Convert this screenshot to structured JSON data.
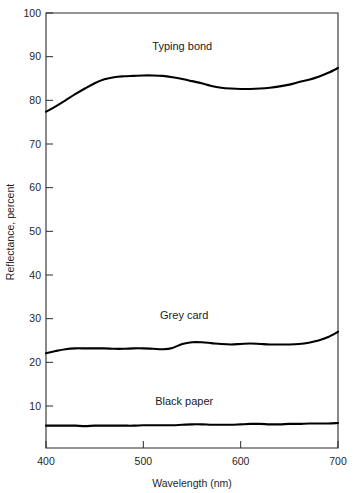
{
  "chart_data": {
    "type": "line",
    "title": "",
    "xlabel": "Wavelength (nm)",
    "ylabel": "Reflectance, percent",
    "xlim": [
      400,
      700
    ],
    "ylim": [
      0,
      100
    ],
    "grid": false,
    "legend_position": "inline-annotations",
    "xticks": [
      400,
      500,
      600,
      700
    ],
    "xtick_labels": [
      "400",
      "500",
      "600",
      "700"
    ],
    "yticks": [
      10,
      20,
      30,
      40,
      50,
      60,
      70,
      80,
      90,
      100
    ],
    "ytick_labels": [
      "10",
      "20",
      "30",
      "40",
      "50",
      "60",
      "70",
      "80",
      "90",
      "100"
    ],
    "x": [
      400,
      410,
      420,
      430,
      440,
      450,
      460,
      470,
      480,
      490,
      500,
      510,
      520,
      530,
      540,
      550,
      560,
      570,
      580,
      590,
      600,
      610,
      620,
      630,
      640,
      650,
      660,
      670,
      680,
      690,
      700
    ],
    "series": [
      {
        "name": "Typing bond",
        "label_x": 540,
        "label_y": 91.5,
        "values": [
          77.4,
          78.6,
          80.0,
          81.4,
          82.7,
          83.9,
          84.8,
          85.3,
          85.5,
          85.6,
          85.7,
          85.7,
          85.6,
          85.3,
          84.9,
          84.4,
          83.9,
          83.3,
          82.9,
          82.7,
          82.6,
          82.6,
          82.7,
          82.9,
          83.2,
          83.6,
          84.2,
          84.7,
          85.4,
          86.3,
          87.4
        ]
      },
      {
        "name": "Grey card",
        "label_x": 542,
        "label_y": 30.0,
        "values": [
          22.1,
          22.6,
          23.0,
          23.2,
          23.2,
          23.2,
          23.2,
          23.1,
          23.1,
          23.2,
          23.2,
          23.1,
          23.0,
          23.3,
          24.2,
          24.6,
          24.6,
          24.4,
          24.2,
          24.1,
          24.2,
          24.3,
          24.2,
          24.1,
          24.1,
          24.1,
          24.2,
          24.5,
          25.0,
          25.8,
          27.0
        ]
      },
      {
        "name": "Black paper",
        "label_x": 542,
        "label_y": 10.2,
        "values": [
          5.5,
          5.5,
          5.5,
          5.5,
          5.4,
          5.5,
          5.5,
          5.5,
          5.5,
          5.5,
          5.6,
          5.6,
          5.6,
          5.6,
          5.7,
          5.8,
          5.8,
          5.7,
          5.7,
          5.7,
          5.8,
          5.9,
          5.9,
          5.8,
          5.8,
          5.9,
          5.9,
          6.0,
          6.0,
          6.0,
          6.1
        ]
      }
    ],
    "colors": {
      "curve": "#000000",
      "axis": "#2b2b2b",
      "background": "#ffffff",
      "text": "#1f1f1f"
    }
  },
  "figure": {
    "y_axis_title": "Reflectance, percent",
    "x_axis_title": "Wavelength (nm)",
    "labels": {
      "typing_bond": "Typing bond",
      "grey_card": "Grey card",
      "black_paper": "Black paper"
    }
  }
}
